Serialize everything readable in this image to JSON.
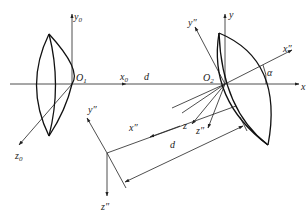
{
  "diagram": {
    "type": "optics coordinate-frame diagram",
    "labels": {
      "y0": "y",
      "y0_sub": "0",
      "z0": "z",
      "z0_sub": "0",
      "O1": "O",
      "O1_sub": "1",
      "x0": "x",
      "x0_sub": "0",
      "d_axis": "d",
      "O2": "O",
      "O2_sub": "2",
      "y": "y",
      "x": "x",
      "y_dd_top": "y″",
      "x_dd_top": "x″",
      "alpha": "α",
      "z": "z",
      "z_dd": "z″",
      "y_dd_frame": "y″",
      "x_dd_frame": "x″",
      "z_dd_frame": "z″",
      "d_dimension": "d"
    },
    "elements": [
      "left lens at origin O1 with axes x0, y0, z0",
      "right lens tilted by angle alpha at origin O2 with axes x, y, z and x'', y'', z''",
      "translated frame x'', y'', z'' with dimension d"
    ],
    "line_color": "#222222",
    "background": "#ffffff"
  }
}
